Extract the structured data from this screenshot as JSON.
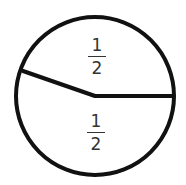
{
  "diagram": {
    "type": "fraction-circle",
    "stroke_color": "#111111",
    "circle": {
      "cx": 95,
      "cy": 96,
      "r": 80
    },
    "divider_lines": [
      {
        "from": [
          24,
          71
        ],
        "to": [
          95,
          96
        ]
      },
      {
        "from": [
          95,
          96
        ],
        "to": [
          175,
          96
        ]
      }
    ],
    "regions": [
      {
        "position": "top",
        "numerator": "1",
        "denominator": "2"
      },
      {
        "position": "bottom",
        "numerator": "1",
        "denominator": "2"
      }
    ]
  }
}
